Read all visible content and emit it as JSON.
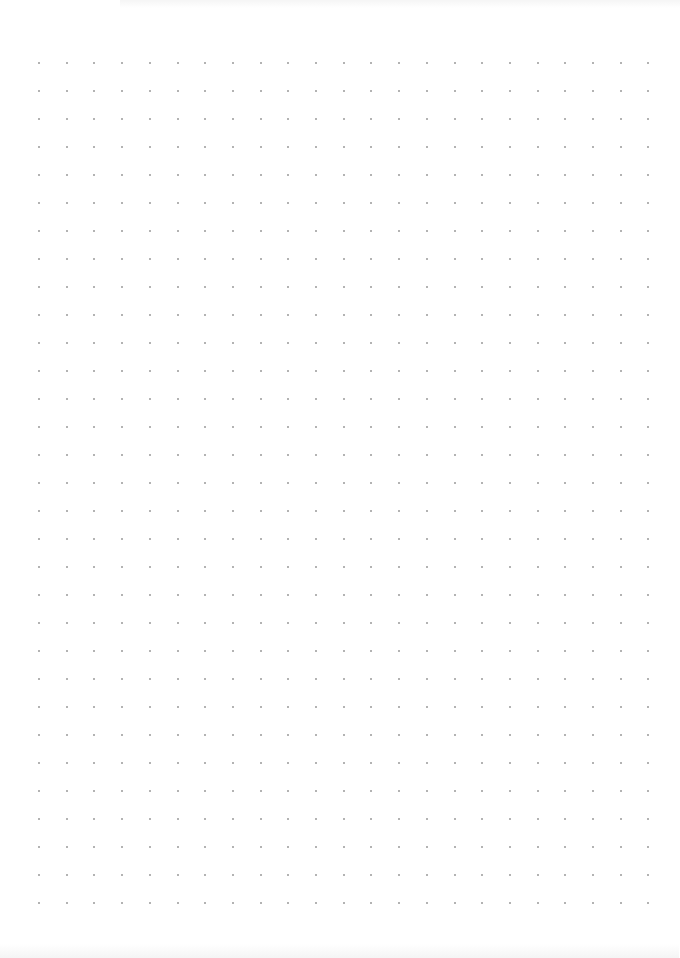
{
  "page": {
    "type": "dot-grid-paper",
    "background_color": "#ffffff"
  },
  "grid": {
    "columns": 23,
    "rows": 31,
    "origin_x": 39,
    "origin_y": 63,
    "spacing_x": 27.7,
    "spacing_y": 28,
    "dot_size": 2,
    "dot_color": "#9a9a9a"
  }
}
